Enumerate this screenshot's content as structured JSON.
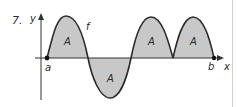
{
  "problem": {
    "number": "7.",
    "labels": {
      "y_axis": "y",
      "x_axis": "x",
      "function": "f",
      "left_endpoint": "a",
      "right_endpoint": "b",
      "region": "A"
    },
    "regions": [
      {
        "label": "A",
        "position": "above"
      },
      {
        "label": "A",
        "position": "below"
      },
      {
        "label": "A",
        "position": "above"
      },
      {
        "label": "A",
        "position": "above"
      }
    ],
    "colors": {
      "fill": "#c8c8c8",
      "curve": "#2b2b2b",
      "axis": "#333333"
    }
  }
}
